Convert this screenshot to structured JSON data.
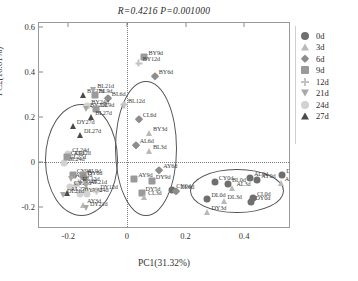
{
  "chart_data": {
    "type": "scatter",
    "title": "R=0.4216  P=0.001000",
    "title_parts": {
      "r_label": "R",
      "r_value": "0.4216",
      "p_label": "P",
      "p_value": "0.001000"
    },
    "xlabel": "PC1(31.32%)",
    "ylabel": "PC2(16.61%)",
    "xlim": [
      -0.3,
      0.56
    ],
    "ylim": [
      -0.3,
      0.62
    ],
    "xticks": [
      -0.2,
      0,
      0.2,
      0.4
    ],
    "xticklabels": [
      "-0.2",
      "0",
      "0.2",
      "0.4"
    ],
    "yticks": [
      0.6,
      0.4,
      0.2,
      0,
      -0.2
    ],
    "yticklabels": [
      "0.6",
      "0.4",
      "0.2",
      "0",
      "-0.2"
    ],
    "grid": false,
    "zero_lines": {
      "vertical_x": 0,
      "horizontal_y": 0,
      "style": "dotted"
    },
    "legend": {
      "position": "right",
      "entries": [
        {
          "label": "0d",
          "marker": "circle",
          "color": "#6f6f6f"
        },
        {
          "label": "3d",
          "marker": "triangle-up",
          "color": "#b9b9b9"
        },
        {
          "label": "6d",
          "marker": "diamond",
          "color": "#8d8d8d"
        },
        {
          "label": "9d",
          "marker": "square",
          "color": "#9a9a9a"
        },
        {
          "label": "12d",
          "marker": "plus",
          "color": "#c3c3c3"
        },
        {
          "label": "21d",
          "marker": "triangle-down",
          "color": "#a8a8a8"
        },
        {
          "label": "24d",
          "marker": "circle",
          "color": "#d2d2d2"
        },
        {
          "label": "27d",
          "marker": "triangle-up",
          "color": "#4a4a4a"
        }
      ]
    },
    "ellipses": [
      {
        "name": "left-cluster",
        "cx": -0.155,
        "cy": 0.01,
        "rx": 0.125,
        "ry": 0.25,
        "rotation": 0
      },
      {
        "name": "middle-cluster",
        "cx": 0.065,
        "cy": 0.06,
        "rx": 0.105,
        "ry": 0.3,
        "rotation": 0
      },
      {
        "name": "right-cluster",
        "cx": 0.375,
        "cy": -0.13,
        "rx": 0.16,
        "ry": 0.1,
        "rotation": 0
      }
    ],
    "points": [
      {
        "label": "BY9d",
        "x": 0.06,
        "y": 0.47,
        "group": "9d"
      },
      {
        "label": "BY12d",
        "x": 0.04,
        "y": 0.44,
        "group": "12d"
      },
      {
        "label": "BY6d",
        "x": 0.095,
        "y": 0.385,
        "group": "6d"
      },
      {
        "label": "BL12d",
        "x": -0.01,
        "y": 0.255,
        "group": "12d"
      },
      {
        "label": "CL6d",
        "x": 0.04,
        "y": 0.19,
        "group": "6d"
      },
      {
        "label": "BY3d",
        "x": 0.075,
        "y": 0.13,
        "group": "3d"
      },
      {
        "label": "AL6d",
        "x": 0.03,
        "y": 0.075,
        "group": "6d"
      },
      {
        "label": "BL3d",
        "x": 0.075,
        "y": 0.05,
        "group": "3d"
      },
      {
        "label": "AY6d",
        "x": 0.11,
        "y": -0.035,
        "group": "6d"
      },
      {
        "label": "AY9d",
        "x": 0.025,
        "y": -0.075,
        "group": "9d"
      },
      {
        "label": "DY9d",
        "x": 0.085,
        "y": -0.085,
        "group": "9d"
      },
      {
        "label": "DY5d",
        "x": 0.05,
        "y": -0.14,
        "group": "9d"
      },
      {
        "label": "CL3d",
        "x": 0.058,
        "y": -0.155,
        "group": "3d"
      },
      {
        "label": "CY0d",
        "x": 0.155,
        "y": -0.125,
        "group": "0d"
      },
      {
        "label": "DL6d",
        "x": 0.168,
        "y": -0.13,
        "group": "6d"
      },
      {
        "label": "BY27d",
        "x": -0.15,
        "y": 0.3,
        "group": "27d"
      },
      {
        "label": "BL21d",
        "x": -0.115,
        "y": 0.32,
        "group": "21d"
      },
      {
        "label": "BL9d",
        "x": -0.11,
        "y": 0.3,
        "group": "9d"
      },
      {
        "label": "BL6d",
        "x": -0.065,
        "y": 0.285,
        "group": "6d"
      },
      {
        "label": "BY24d",
        "x": -0.135,
        "y": 0.25,
        "group": "24d"
      },
      {
        "label": "BY21d",
        "x": -0.14,
        "y": 0.235,
        "group": "21d"
      },
      {
        "label": "DL9d",
        "x": -0.105,
        "y": 0.235,
        "group": "9d"
      },
      {
        "label": "BL27d",
        "x": -0.122,
        "y": 0.2,
        "group": "27d"
      },
      {
        "label": "DY27d",
        "x": -0.185,
        "y": 0.16,
        "group": "27d"
      },
      {
        "label": "DL27d",
        "x": -0.16,
        "y": 0.12,
        "group": "27d"
      },
      {
        "label": "CL24d",
        "x": -0.2,
        "y": 0.035,
        "group": "24d"
      },
      {
        "label": "AL12d",
        "x": -0.195,
        "y": 0.02,
        "group": "12d"
      },
      {
        "label": "CL27d",
        "x": -0.21,
        "y": 0.005,
        "group": "27d"
      },
      {
        "label": "BL24d",
        "x": -0.215,
        "y": -0.005,
        "group": "24d"
      },
      {
        "label": "CY9d",
        "x": -0.185,
        "y": -0.06,
        "group": "9d"
      },
      {
        "label": "AY21d",
        "x": -0.19,
        "y": -0.075,
        "group": "21d"
      },
      {
        "label": "AL9d",
        "x": -0.15,
        "y": -0.06,
        "group": "9d"
      },
      {
        "label": "DY6d",
        "x": -0.148,
        "y": -0.068,
        "group": "6d"
      },
      {
        "label": "DL12d",
        "x": -0.165,
        "y": -0.095,
        "group": "12d"
      },
      {
        "label": "CY12d",
        "x": -0.175,
        "y": -0.105,
        "group": "12d"
      },
      {
        "label": "CY24d",
        "x": -0.195,
        "y": -0.112,
        "group": "24d"
      },
      {
        "label": "AL21d",
        "x": -0.14,
        "y": -0.11,
        "group": "21d"
      },
      {
        "label": "AL27d",
        "x": -0.205,
        "y": -0.14,
        "group": "27d"
      },
      {
        "label": "DY24d",
        "x": -0.16,
        "y": -0.145,
        "group": "24d"
      },
      {
        "label": "AY24d",
        "x": -0.135,
        "y": -0.142,
        "group": "24d"
      },
      {
        "label": "DY12d",
        "x": -0.105,
        "y": -0.132,
        "group": "12d"
      },
      {
        "label": "DL21d",
        "x": -0.218,
        "y": -0.15,
        "group": "21d"
      },
      {
        "label": "AY3d",
        "x": -0.15,
        "y": -0.195,
        "group": "3d"
      },
      {
        "label": "DY21d",
        "x": -0.14,
        "y": -0.205,
        "group": "21d"
      },
      {
        "label": "CL9d",
        "x": -0.205,
        "y": 0.02,
        "group": "9d"
      },
      {
        "label": "AL0d",
        "x": 0.42,
        "y": -0.07,
        "group": "0d"
      },
      {
        "label": "AY0d",
        "x": 0.445,
        "y": -0.08,
        "group": "0d"
      },
      {
        "label": "CY0d",
        "x": 0.3,
        "y": -0.09,
        "group": "0d"
      },
      {
        "label": "BL0d",
        "x": 0.345,
        "y": -0.098,
        "group": "0d"
      },
      {
        "label": "AL3d",
        "x": 0.36,
        "y": -0.118,
        "group": "3d"
      },
      {
        "label": "DL0d",
        "x": 0.275,
        "y": -0.165,
        "group": "0d"
      },
      {
        "label": "DL3d",
        "x": 0.33,
        "y": -0.175,
        "group": "3d"
      },
      {
        "label": "CL0d",
        "x": 0.43,
        "y": -0.16,
        "group": "0d"
      },
      {
        "label": "DY0d",
        "x": 0.425,
        "y": -0.178,
        "group": "0d"
      },
      {
        "label": "DY3d",
        "x": 0.275,
        "y": -0.222,
        "group": "3d"
      },
      {
        "label": "DY0d2",
        "x": 0.53,
        "y": -0.06,
        "group": "0d"
      },
      {
        "label": "AL3d2",
        "x": 0.525,
        "y": -0.095,
        "group": "3d"
      }
    ]
  }
}
